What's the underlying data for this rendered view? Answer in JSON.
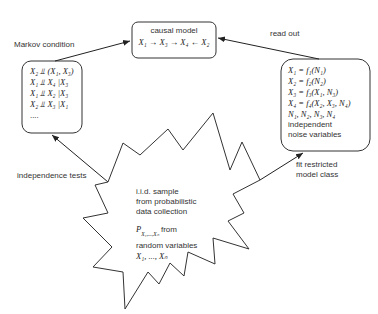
{
  "causal_model": {
    "title": "causal model",
    "graph": "X₁ → X₃ → X₄ ← X₂"
  },
  "markov_box": {
    "label": "Markov condition",
    "lines": [
      "X₂ ⫫ (X₁, X₃)",
      "X₁ ⫫ X₄ |X₃",
      "X₁ ⫫ X₂ |X₃",
      "X₂ ⫫ X₃ |X₁",
      "...."
    ]
  },
  "equations_box": {
    "label": "read out",
    "lines": [
      "X₁ = f₁(N₁)",
      "X₂ = f₂(N₂)",
      "X₃ = f₃(X₁, N₃)",
      "X₄ = f₄(X₂, X₃, N₄)",
      "N₁, N₂, N₃, N₄"
    ],
    "note_lines": [
      "independent",
      "noise variables"
    ]
  },
  "data_star": {
    "lines": [
      "i.i.d. sample",
      "from probabilistic",
      "data collection"
    ],
    "dist_symbol": "P",
    "dist_subscript": "X₁,...,Xₙ",
    "dist_suffix": " from",
    "line_random": "random variables",
    "variables": "X₁, ..., Xₙ"
  },
  "edges": {
    "independence_tests": "independence tests",
    "fit_line1": "fit restricted",
    "fit_line2": "model class"
  }
}
